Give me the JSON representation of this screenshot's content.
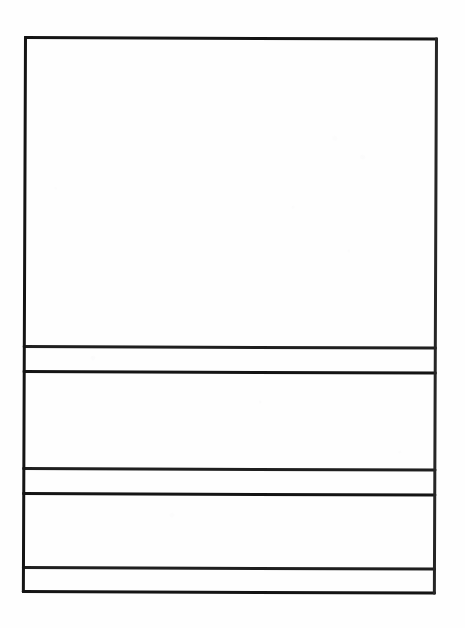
{
  "document": {
    "kind": "scanned-blank-form",
    "title": "Blank ruled form",
    "page_width": 465,
    "page_height": 628,
    "background_color": "#fefefe",
    "ink_color": "#1c1c1c",
    "skew_degrees": 0.22,
    "content_text": "",
    "notes": "No printed or handwritten text is visible anywhere on the page."
  },
  "table": {
    "x": 24,
    "y": 36,
    "width": 414,
    "height": 557,
    "border_weight_px": 3,
    "column_count": 1,
    "row_count": 5,
    "rules": [
      {
        "name": "top-border",
        "orientation": "horizontal",
        "y": 0,
        "weight": 3
      },
      {
        "name": "divider-1",
        "orientation": "horizontal",
        "y": 309,
        "weight": 3
      },
      {
        "name": "divider-2",
        "orientation": "horizontal",
        "y": 334,
        "weight": 3
      },
      {
        "name": "divider-3",
        "orientation": "horizontal",
        "y": 431,
        "weight": 3
      },
      {
        "name": "divider-4",
        "orientation": "horizontal",
        "y": 456,
        "weight": 3
      },
      {
        "name": "divider-5",
        "orientation": "horizontal",
        "y": 530,
        "weight": 3
      },
      {
        "name": "bottom-border",
        "orientation": "horizontal",
        "y": 554,
        "weight": 3
      },
      {
        "name": "left-border",
        "orientation": "vertical",
        "x": 0,
        "weight": 3
      },
      {
        "name": "right-border",
        "orientation": "vertical",
        "x": 411,
        "weight": 3
      }
    ],
    "rows": [
      {
        "name": "row-1",
        "label": "",
        "value": "",
        "top": 3,
        "height": 306,
        "kind": "large-blank-block"
      },
      {
        "name": "row-2",
        "label": "",
        "value": "",
        "top": 312,
        "height": 22,
        "kind": "narrow-blank-strip"
      },
      {
        "name": "row-3",
        "label": "",
        "value": "",
        "top": 337,
        "height": 94,
        "kind": "medium-blank-block"
      },
      {
        "name": "row-4",
        "label": "",
        "value": "",
        "top": 434,
        "height": 22,
        "kind": "narrow-blank-strip"
      },
      {
        "name": "row-5",
        "label": "",
        "value": "",
        "top": 459,
        "height": 71,
        "kind": "medium-blank-block"
      },
      {
        "name": "row-6",
        "label": "",
        "value": "",
        "top": 533,
        "height": 21,
        "kind": "narrow-blank-strip"
      }
    ]
  }
}
